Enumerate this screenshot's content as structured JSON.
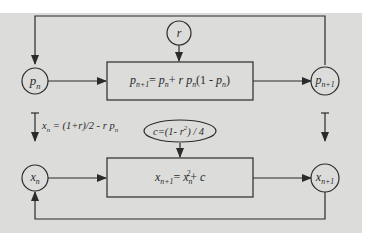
{
  "diagram": {
    "nodes": {
      "p_n": {
        "var": "p",
        "sub": "n"
      },
      "p_n1": {
        "var": "p",
        "sub": "n+1"
      },
      "x_n": {
        "var": "x",
        "sub": "n"
      },
      "x_n1": {
        "var": "x",
        "sub": "n+1"
      },
      "r": {
        "var": "r"
      }
    },
    "boxes": {
      "logistic": {
        "lhs_var": "p",
        "lhs_sub": "n+1",
        "eq": "=",
        "t1_var": "p",
        "t1_sub": "n",
        "plus": "+",
        "t2_r": "r",
        "t2_var": "p",
        "t2_sub": "n",
        "paren_open": "(1 - ",
        "t3_var": "p",
        "t3_sub": "n",
        "paren_close": ")"
      },
      "quadratic": {
        "lhs_var": "x",
        "lhs_sub": "n+1",
        "eq": "=",
        "t1_var": "x",
        "t1_sub": "n",
        "t1_sup": "2",
        "plus": "+",
        "c": "c"
      }
    },
    "ellipse": {
      "prefix": "c=(1- ",
      "r": "r",
      "sup": "2",
      "suffix": ") / 4"
    },
    "transform_label": {
      "lhs_var": "x",
      "lhs_sub": "n",
      "middle": " = (1+r)/2 - r ",
      "rhs_var": "p",
      "rhs_sub": "n"
    },
    "colors": {
      "background": "#ffffff",
      "panel": "#dcdcdb",
      "stroke": "#2b2b2b"
    }
  }
}
